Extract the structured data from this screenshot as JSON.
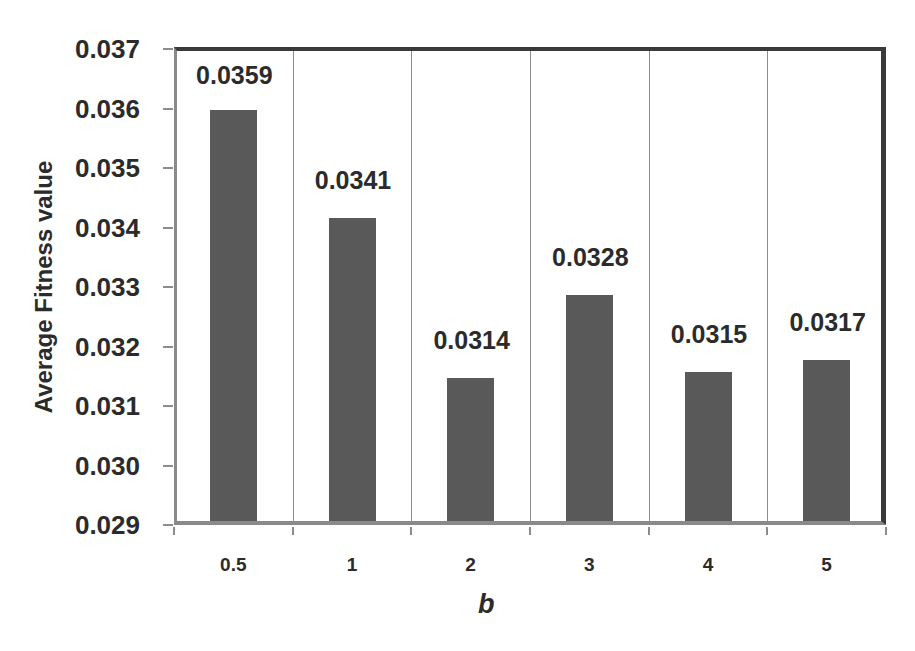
{
  "chart_data": {
    "type": "bar",
    "title": "",
    "xlabel": "b",
    "ylabel": "Average Fitness value",
    "categories": [
      "0.5",
      "1",
      "2",
      "3",
      "4",
      "5"
    ],
    "values": [
      0.0359,
      0.0341,
      0.0314,
      0.0328,
      0.0315,
      0.0317
    ],
    "data_labels": [
      "0.0359",
      "0.0341",
      "0.0314",
      "0.0328",
      "0.0315",
      "0.0317"
    ],
    "ylim": [
      0.029,
      0.037
    ],
    "yticks": [
      "0.037",
      "0.036",
      "0.035",
      "0.034",
      "0.033",
      "0.032",
      "0.031",
      "0.030",
      "0.029"
    ],
    "grid": {
      "vertical": true,
      "horizontal": false
    },
    "legend": null,
    "bar_color": "#595959"
  }
}
